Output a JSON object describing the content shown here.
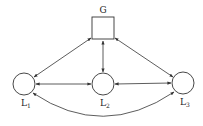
{
  "diagram": {
    "nodes": [
      {
        "id": "G",
        "label": "G",
        "shape": "square",
        "x": 103,
        "y": 28,
        "size": 22
      },
      {
        "id": "L1",
        "label": "L",
        "sub": "1",
        "shape": "circle",
        "x": 24,
        "y": 84,
        "r": 11
      },
      {
        "id": "L2",
        "label": "L",
        "sub": "2",
        "shape": "circle",
        "x": 103,
        "y": 84,
        "r": 11
      },
      {
        "id": "L3",
        "label": "L",
        "sub": "3",
        "shape": "circle",
        "x": 183,
        "y": 83,
        "r": 11
      }
    ],
    "edges": [
      {
        "from": "G",
        "to": "L1",
        "type": "bidirectional"
      },
      {
        "from": "G",
        "to": "L2",
        "type": "bidirectional"
      },
      {
        "from": "G",
        "to": "L3",
        "type": "bidirectional"
      },
      {
        "from": "L1",
        "to": "L2",
        "type": "bidirectional"
      },
      {
        "from": "L2",
        "to": "L3",
        "type": "bidirectional"
      },
      {
        "from": "L1",
        "to": "L3",
        "type": "bidirectional",
        "curved": true
      }
    ],
    "colors": {
      "stroke": "#333333",
      "background": "#ffffff"
    }
  },
  "labels": {
    "g": "G",
    "l1_main": "L",
    "l1_sub": "1",
    "l2_main": "L",
    "l2_sub": "2",
    "l3_main": "L",
    "l3_sub": "3"
  }
}
